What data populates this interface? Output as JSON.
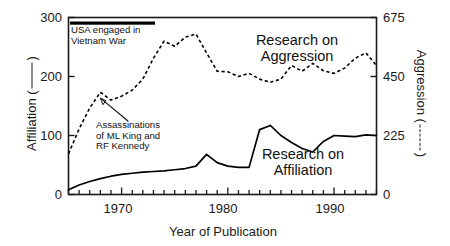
{
  "chart_data": {
    "type": "line",
    "title": "",
    "xlabel": "Year of Publication",
    "ylabel": "Affiliation (     )",
    "ylabel_right": "Aggression (      )",
    "xlim": [
      1965,
      1994
    ],
    "ylim": [
      0,
      300
    ],
    "ylim_right": [
      0,
      675
    ],
    "xticks_labeled": [
      1970,
      1980,
      1990
    ],
    "xtick_labels": [
      "1970",
      "1980",
      "1990"
    ],
    "yticks": [
      0,
      100,
      200,
      300
    ],
    "ytick_labels": [
      "0",
      "100",
      "200",
      "300"
    ],
    "yticks_right": [
      0,
      225,
      450,
      675
    ],
    "ytick_labels_right": [
      "0",
      "225",
      "450",
      "675"
    ],
    "grid": false,
    "legend_position": "inline-annotations",
    "series": [
      {
        "name": "Research on Affiliation",
        "axis": "left",
        "style": "solid",
        "color": "#000000",
        "x": [
          1965,
          1966,
          1967,
          1968,
          1969,
          1970,
          1971,
          1972,
          1973,
          1974,
          1975,
          1976,
          1977,
          1978,
          1979,
          1980,
          1981,
          1982,
          1983,
          1984,
          1985,
          1986,
          1987,
          1988,
          1989,
          1990,
          1991,
          1992,
          1993,
          1994
        ],
        "values": [
          8,
          16,
          22,
          27,
          31,
          34,
          36,
          38,
          39,
          40,
          42,
          44,
          48,
          68,
          54,
          48,
          46,
          46,
          110,
          117,
          100,
          88,
          78,
          72,
          90,
          100,
          99,
          98,
          101,
          100
        ]
      },
      {
        "name": "Research on Aggression",
        "axis": "right",
        "style": "dashed",
        "color": "#000000",
        "x": [
          1965,
          1966,
          1967,
          1968,
          1969,
          1970,
          1971,
          1972,
          1973,
          1974,
          1975,
          1976,
          1977,
          1978,
          1979,
          1980,
          1981,
          1982,
          1983,
          1984,
          1985,
          1986,
          1987,
          1988,
          1989,
          1990,
          1991,
          1992,
          1993,
          1994
        ],
        "values": [
          155,
          250,
          330,
          390,
          360,
          375,
          398,
          440,
          520,
          585,
          565,
          600,
          612,
          540,
          470,
          468,
          450,
          462,
          440,
          428,
          440,
          492,
          470,
          500,
          472,
          462,
          482,
          520,
          540,
          492
        ]
      }
    ],
    "annotations": [
      {
        "name": "vietnam-war",
        "text_lines": [
          "USA engaged in",
          "Vietnam War"
        ],
        "bar_start_year": 1965,
        "bar_end_year": 1973
      },
      {
        "name": "assassinations",
        "text_lines": [
          "Assassinations",
          "of ML King and",
          "RF Kennedy"
        ],
        "points_to_year": 1968
      }
    ],
    "series_labels": [
      {
        "name": "aggression-label",
        "lines": [
          "Research on",
          "Aggression"
        ]
      },
      {
        "name": "affiliation-label",
        "lines": [
          "Research on",
          "Affiliation"
        ]
      }
    ]
  },
  "axes": {
    "left_title": "Affiliation (",
    "left_title_tail": ")",
    "right_title": "Aggression (",
    "right_title_tail": ")",
    "x_title": "Year of Publication"
  },
  "colors": {
    "axis": "#1a1a1a",
    "line": "#000000",
    "background": "#ffffff"
  }
}
